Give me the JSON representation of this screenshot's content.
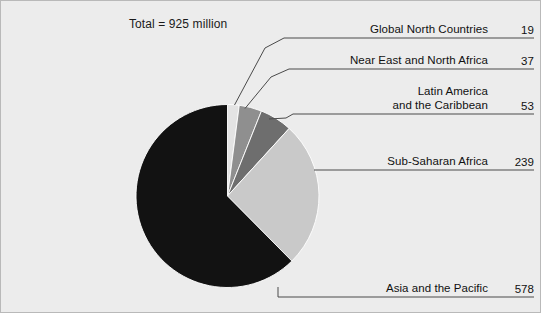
{
  "caption": {
    "total_text": "Total = 925 million"
  },
  "colors": {
    "background": "#ececec",
    "frame": "#b9b9b9",
    "text": "#111111",
    "leader_line": "#4a4a4a",
    "slice_global_north": "#e3e3e3",
    "slice_near_east": "#8f8f8f",
    "slice_latin_america": "#6e6e6e",
    "slice_sub_saharan": "#c9c9c9",
    "slice_asia": "#121212"
  },
  "chart_data": {
    "type": "pie",
    "title": "Total = 925 million",
    "total": 925,
    "unit": "million",
    "legend_position": "callout-right",
    "labels": [
      "Global North Countries",
      "Near East and North Africa",
      "Latin America and the Caribbean",
      "Sub-Saharan Africa",
      "Asia and the Pacific"
    ],
    "values": [
      19,
      37,
      53,
      239,
      578
    ],
    "colors": [
      "#e3e3e3",
      "#8f8f8f",
      "#6e6e6e",
      "#c9c9c9",
      "#121212"
    ],
    "start_angle_deg": 0,
    "direction": "clockwise"
  },
  "callouts": [
    {
      "id": "global-north",
      "label_line1": "Global North Countries",
      "label_line2": "",
      "value": "19"
    },
    {
      "id": "near-east",
      "label_line1": "Near East and North Africa",
      "label_line2": "",
      "value": "37"
    },
    {
      "id": "latin-america",
      "label_line1": "Latin America",
      "label_line2": "and the Caribbean",
      "value": "53"
    },
    {
      "id": "sub-saharan",
      "label_line1": "Sub-Saharan Africa",
      "label_line2": "",
      "value": "239"
    },
    {
      "id": "asia-pacific",
      "label_line1": "Asia and the Pacific",
      "label_line2": "",
      "value": "578"
    }
  ]
}
